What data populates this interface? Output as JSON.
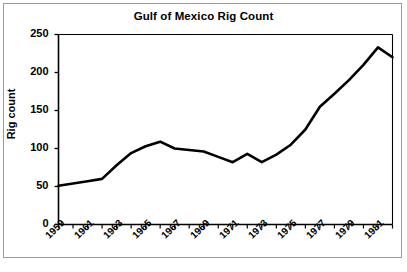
{
  "figure": {
    "title": "Gulf of Mexico Rig Count",
    "caption": ""
  },
  "axes": {
    "ylabel": "Rig count",
    "yticks": [
      "0",
      "50",
      "100",
      "150",
      "200",
      "250"
    ],
    "xticks": [
      "1959",
      "1961",
      "1963",
      "1965",
      "1967",
      "1969",
      "1971",
      "1973",
      "1975",
      "1977",
      "1979",
      "1981"
    ]
  },
  "colors": {
    "line": "#000000",
    "axis": "#000000",
    "frame": "#9a9a9a",
    "background": "#ffffff"
  },
  "chart_data": {
    "type": "line",
    "title": "Gulf of Mexico Rig Count",
    "xlabel": "",
    "ylabel": "Rig count",
    "ylim": [
      0,
      250
    ],
    "xlim": [
      1959,
      1982
    ],
    "grid": false,
    "legend": null,
    "x": [
      1959,
      1960,
      1961,
      1962,
      1963,
      1964,
      1965,
      1966,
      1967,
      1968,
      1969,
      1970,
      1971,
      1972,
      1973,
      1974,
      1975,
      1976,
      1977,
      1978,
      1979,
      1980,
      1981,
      1982
    ],
    "categories": [
      "1959",
      "1960",
      "1961",
      "1962",
      "1963",
      "1964",
      "1965",
      "1966",
      "1967",
      "1968",
      "1969",
      "1970",
      "1971",
      "1972",
      "1973",
      "1974",
      "1975",
      "1976",
      "1977",
      "1978",
      "1979",
      "1980",
      "1981",
      "1982"
    ],
    "values": [
      51,
      54,
      57,
      60,
      78,
      94,
      103,
      109,
      100,
      98,
      96,
      89,
      82,
      93,
      82,
      92,
      105,
      125,
      155,
      172,
      190,
      210,
      233,
      220
    ],
    "series": [
      {
        "name": "Rig count",
        "values": [
          51,
          54,
          57,
          60,
          78,
          94,
          103,
          109,
          100,
          98,
          96,
          89,
          82,
          93,
          82,
          92,
          105,
          125,
          155,
          172,
          190,
          210,
          233,
          220
        ]
      }
    ]
  }
}
